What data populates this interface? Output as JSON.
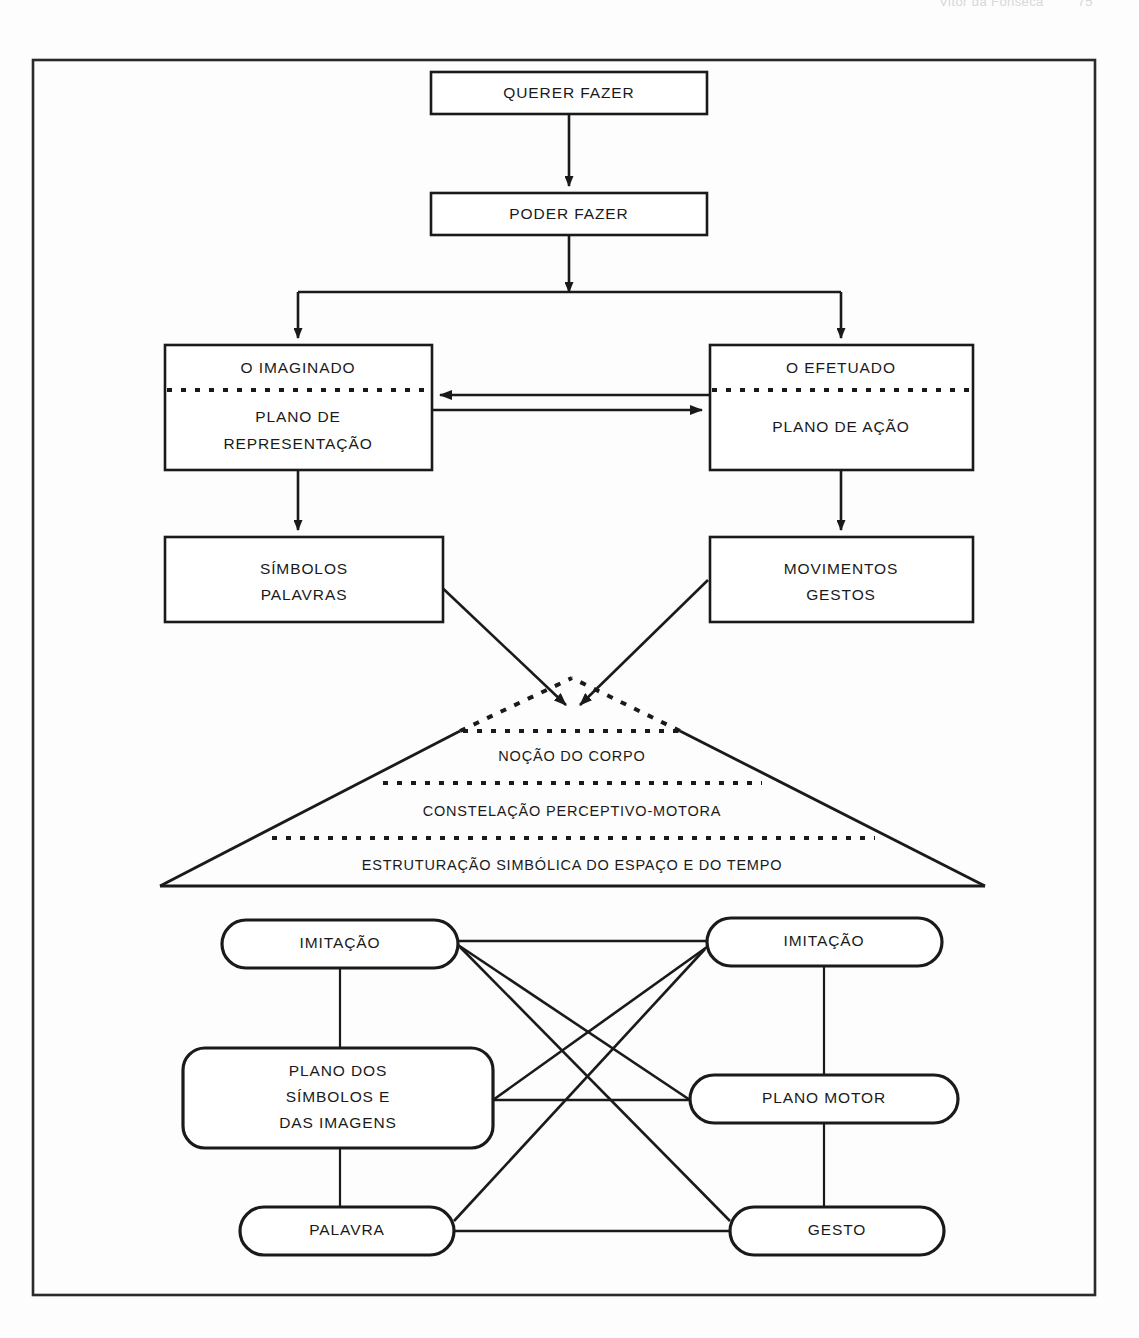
{
  "page": {
    "running_head": "Vitor da Fonseca",
    "folio": "75"
  },
  "figure": {
    "frame": {
      "x": 33,
      "y": 60,
      "width": 1062,
      "height": 1235
    },
    "nodes": {
      "querer_fazer": {
        "label": "QUERER FAZER",
        "x": 431,
        "y": 72,
        "width": 276,
        "height": 42
      },
      "poder_fazer": {
        "label": "PODER FAZER",
        "x": 431,
        "y": 193,
        "width": 276,
        "height": 42
      },
      "imaginado": {
        "title": "O IMAGINADO",
        "line1": "PLANO DE",
        "line2": "REPRESENTAÇÃO",
        "x": 165,
        "y": 345,
        "width": 267,
        "height": 125
      },
      "efetuado": {
        "title": "O EFETUADO",
        "line1": "PLANO DE AÇÃO",
        "line2": "",
        "x": 710,
        "y": 345,
        "width": 263,
        "height": 125
      },
      "simbolos": {
        "line1": "SÍMBOLOS",
        "line2": "PALAVRAS",
        "x": 165,
        "y": 537,
        "width": 278,
        "height": 85
      },
      "movimentos": {
        "line1": "MOVIMENTOS",
        "line2": "GESTOS",
        "x": 710,
        "y": 537,
        "width": 263,
        "height": 85
      }
    },
    "triangle": {
      "layers": [
        "NOÇÃO DO CORPO",
        "CONSTELAÇÃO PERCEPTIVO-MOTORA",
        "ESTRUTURAÇÃO SIMBÓLICA DO ESPAÇO E DO TEMPO"
      ],
      "apex_x": 572,
      "apex_y": 678,
      "base_left_x": 160,
      "base_right_x": 985,
      "base_y": 886
    },
    "network": {
      "imitacao_left": {
        "label": "IMITAÇÃO",
        "x": 222,
        "y": 920,
        "width": 236,
        "height": 48
      },
      "imitacao_right": {
        "label": "IMITAÇÃO",
        "x": 707,
        "y": 918,
        "width": 235,
        "height": 48
      },
      "plano_simbolos": {
        "line1": "PLANO DOS",
        "line2": "SÍMBOLOS E",
        "line3": "DAS IMAGENS",
        "x": 183,
        "y": 1048,
        "width": 310,
        "height": 100
      },
      "plano_motor": {
        "label": "PLANO MOTOR",
        "x": 690,
        "y": 1075,
        "width": 268,
        "height": 48
      },
      "palavra": {
        "label": "PALAVRA",
        "x": 240,
        "y": 1207,
        "width": 214,
        "height": 48
      },
      "gesto": {
        "label": "GESTO",
        "x": 730,
        "y": 1207,
        "width": 214,
        "height": 48
      }
    }
  },
  "colors": {
    "ink": "#1a1a1a",
    "paper": "#fdfdfd",
    "faint": "#d7d7db"
  }
}
